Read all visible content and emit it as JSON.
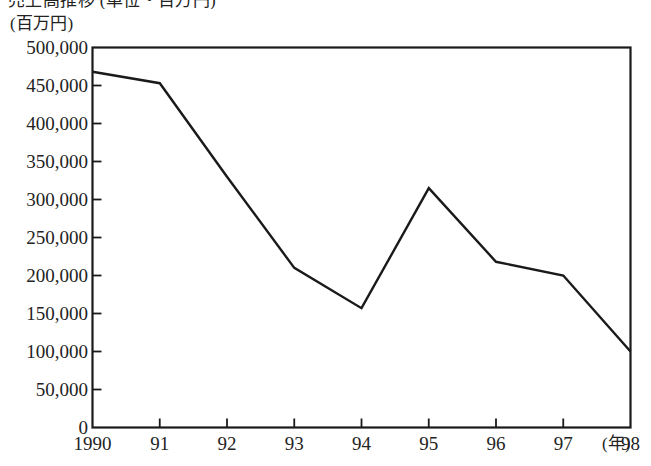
{
  "figure": {
    "title_partial": "売上高推移 (単位・百万円)",
    "y_unit_label": "(百万円)",
    "x_unit_label": "(年)"
  },
  "chart_data": {
    "type": "line",
    "title": "売上高推移 (単位・百万円)",
    "xlabel": "(年)",
    "ylabel": "(百万円)",
    "categories": [
      "1990",
      "91",
      "92",
      "93",
      "94",
      "95",
      "96",
      "97",
      "98"
    ],
    "values": [
      468000,
      453000,
      330000,
      210000,
      157000,
      315000,
      218000,
      200000,
      100000
    ],
    "ylim": [
      0,
      500000
    ],
    "ytick_labels": [
      "500,000",
      "450,000",
      "400,000",
      "350,000",
      "300,000",
      "250,000",
      "200,000",
      "150,000",
      "100,000",
      "50,000",
      "0"
    ],
    "ytick_values": [
      500000,
      450000,
      400000,
      350000,
      300000,
      250000,
      200000,
      150000,
      100000,
      50000,
      0
    ],
    "grid": false,
    "legend": null,
    "line_color": "#1a1a1a",
    "frame_color": "#1a1a1a",
    "background": "#ffffff"
  }
}
